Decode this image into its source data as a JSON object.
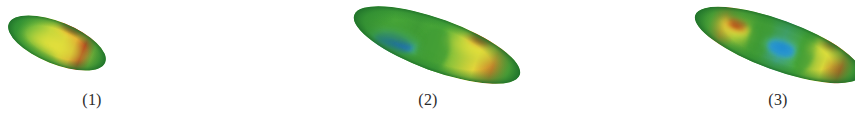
{
  "figure": {
    "background_color": "#ffffff",
    "panel_count": 3,
    "colormap": "jet",
    "colormap_stops": [
      "#1560c8",
      "#2b9bd8",
      "#4fb84a",
      "#3f9b35",
      "#9ec73a",
      "#e6e23a",
      "#f0a030",
      "#c4441e",
      "#a3301a"
    ]
  },
  "panels": [
    {
      "id": "panel-1",
      "label": "(1)",
      "label_center_x": 92,
      "label_top": 92,
      "description": "single-lobe ellipsoid, red-orange crest",
      "shape": {
        "type": "ellipsoid-mode",
        "center_x": 57,
        "center_y": 43,
        "length": 104,
        "width": 42,
        "rotation_deg": 22,
        "lobes": [
          {
            "position": 0.62,
            "sign": "positive",
            "peak_color": "#b23c1a"
          }
        ],
        "edge_color": "#3f9b35",
        "mid_color": "#e8e03a"
      }
    },
    {
      "id": "panel-2",
      "label": "(2)",
      "label_center_x": 428,
      "label_top": 92,
      "description": "two-lobe ellipsoid, blue trough left and orange crest right",
      "shape": {
        "type": "ellipsoid-mode",
        "center_x": 437,
        "center_y": 45,
        "length": 175,
        "width": 52,
        "rotation_deg": 20,
        "lobes": [
          {
            "position": 0.3,
            "sign": "negative",
            "peak_color": "#1560c8"
          },
          {
            "position": 0.72,
            "sign": "positive",
            "peak_color": "#bf4520"
          }
        ],
        "edge_color": "#3f9b35",
        "mid_color": "#e8e03a"
      }
    },
    {
      "id": "panel-3",
      "label": "(3)",
      "label_center_x": 778,
      "label_top": 92,
      "description": "three-lobe ellipsoid, orange crest, blue trough, orange crest",
      "shape": {
        "type": "ellipsoid-mode",
        "center_x": 778,
        "center_y": 45,
        "length": 175,
        "width": 50,
        "rotation_deg": 20,
        "lobes": [
          {
            "position": 0.22,
            "sign": "positive",
            "peak_color": "#c4491d"
          },
          {
            "position": 0.53,
            "sign": "negative",
            "peak_color": "#1f86d0"
          },
          {
            "position": 0.84,
            "sign": "positive",
            "peak_color": "#c4491d"
          }
        ],
        "edge_color": "#3f9b35",
        "mid_color": "#e8e03a"
      }
    }
  ]
}
